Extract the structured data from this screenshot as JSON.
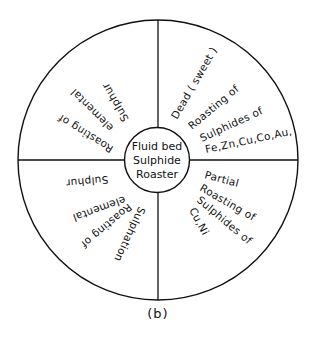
{
  "diagram": {
    "caption": "(b)",
    "colors": {
      "stroke": "#111111",
      "background": "#ffffff"
    },
    "hub": {
      "lines": [
        "Fluid bed",
        "Sulphide",
        "Roaster"
      ]
    },
    "quadrants": {
      "top_right": {
        "lines": [
          "Dead ( sweet )",
          "Roasting of",
          "Sulphides of",
          "Fe,Zn,Cu,Co,Au,"
        ]
      },
      "top_left": {
        "lines": [
          "Roasting of",
          "elemental",
          "Sulphur"
        ]
      },
      "bottom_left": {
        "lines": [
          "Sulphation",
          "Roasting of",
          "elemental",
          "Sulphur"
        ]
      },
      "bottom_right": {
        "lines": [
          "Partial",
          "Roasting of",
          "Sulphides of",
          "Cu,Ni"
        ]
      }
    }
  }
}
